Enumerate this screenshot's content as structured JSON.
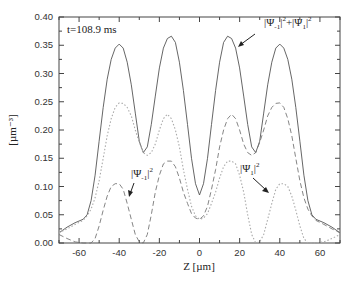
{
  "chart_data": {
    "type": "line",
    "title": "",
    "xlabel": "Z [µm]",
    "ylabel": "[µm⁻³]",
    "xlim": [
      -70,
      70
    ],
    "ylim": [
      0.0,
      0.4
    ],
    "x_ticks": [
      -60,
      -40,
      -20,
      0,
      20,
      40,
      60
    ],
    "x_tick_labels": [
      "-60",
      "-40",
      "-20",
      "0",
      "20",
      "40",
      "60"
    ],
    "y_ticks": [
      0.0,
      0.05,
      0.1,
      0.15,
      0.2,
      0.25,
      0.3,
      0.35,
      0.4
    ],
    "y_tick_labels": [
      "0.00",
      "0.05",
      "0.10",
      "0.15",
      "0.20",
      "0.25",
      "0.30",
      "0.35",
      "0.40"
    ],
    "grid": false,
    "legend": "none (inline annotations)",
    "x": [
      -70,
      -66,
      -62,
      -58,
      -56,
      -54,
      -52,
      -50,
      -48,
      -46,
      -44,
      -42,
      -40,
      -38,
      -36,
      -34,
      -32,
      -30,
      -28,
      -26,
      -24,
      -22,
      -20,
      -18,
      -16,
      -14,
      -12,
      -10,
      -8,
      -6,
      -4,
      -2,
      0,
      2,
      4,
      6,
      8,
      10,
      12,
      14,
      16,
      18,
      20,
      22,
      24,
      26,
      28,
      30,
      32,
      34,
      36,
      38,
      40,
      42,
      44,
      46,
      48,
      50,
      52,
      54,
      56,
      58,
      62,
      66,
      70
    ],
    "series": [
      {
        "name": "|Ψ-1|²+|Ψ1|²",
        "style": "solid",
        "values": [
          0.018,
          0.028,
          0.036,
          0.042,
          0.05,
          0.075,
          0.12,
          0.18,
          0.24,
          0.29,
          0.325,
          0.345,
          0.352,
          0.345,
          0.32,
          0.28,
          0.23,
          0.18,
          0.16,
          0.17,
          0.21,
          0.26,
          0.31,
          0.345,
          0.362,
          0.366,
          0.355,
          0.32,
          0.27,
          0.21,
          0.15,
          0.105,
          0.085,
          0.105,
          0.15,
          0.21,
          0.27,
          0.32,
          0.355,
          0.366,
          0.362,
          0.345,
          0.31,
          0.26,
          0.21,
          0.17,
          0.16,
          0.18,
          0.23,
          0.28,
          0.32,
          0.345,
          0.352,
          0.345,
          0.325,
          0.29,
          0.24,
          0.18,
          0.12,
          0.075,
          0.05,
          0.042,
          0.036,
          0.028,
          0.018
        ]
      },
      {
        "name": "|Ψ-1|²",
        "style": "dashed",
        "values": [
          0.015,
          0.008,
          0.002,
          0.0,
          0.0,
          0.0,
          0.008,
          0.03,
          0.058,
          0.083,
          0.1,
          0.105,
          0.105,
          0.095,
          0.07,
          0.042,
          0.015,
          0.002,
          0.0,
          0.015,
          0.05,
          0.09,
          0.12,
          0.14,
          0.145,
          0.145,
          0.135,
          0.115,
          0.09,
          0.07,
          0.052,
          0.044,
          0.042,
          0.048,
          0.065,
          0.095,
          0.13,
          0.17,
          0.2,
          0.22,
          0.228,
          0.22,
          0.2,
          0.175,
          0.16,
          0.155,
          0.16,
          0.178,
          0.2,
          0.225,
          0.24,
          0.247,
          0.248,
          0.24,
          0.22,
          0.19,
          0.15,
          0.11,
          0.08,
          0.06,
          0.048,
          0.04,
          0.033,
          0.025,
          0.018
        ]
      },
      {
        "name": "|Ψ1|²",
        "style": "dotted",
        "values": [
          0.018,
          0.025,
          0.033,
          0.04,
          0.048,
          0.06,
          0.08,
          0.11,
          0.15,
          0.19,
          0.22,
          0.24,
          0.248,
          0.247,
          0.24,
          0.225,
          0.2,
          0.178,
          0.16,
          0.155,
          0.16,
          0.175,
          0.2,
          0.22,
          0.228,
          0.22,
          0.2,
          0.17,
          0.13,
          0.095,
          0.065,
          0.048,
          0.042,
          0.044,
          0.052,
          0.07,
          0.09,
          0.115,
          0.135,
          0.145,
          0.145,
          0.14,
          0.12,
          0.09,
          0.05,
          0.015,
          0.0,
          0.002,
          0.015,
          0.042,
          0.07,
          0.095,
          0.105,
          0.105,
          0.1,
          0.083,
          0.058,
          0.03,
          0.008,
          0.0,
          0.0,
          0.0,
          0.002,
          0.008,
          0.015
        ]
      }
    ],
    "annotations": [
      {
        "text": "t=108.9 ms"
      },
      {
        "text_main": "|Ψ",
        "sub": "-1",
        "sup": "2",
        "plus": "+|Ψ",
        "sub2": "1",
        "sup2": "2",
        "target": "solid curve"
      },
      {
        "text_main": "|Ψ",
        "sub": "-1",
        "sup": "2",
        "target": "dashed curve"
      },
      {
        "text_main": "|Ψ",
        "sub": "1",
        "sup": "2",
        "target": "dotted curve"
      }
    ]
  }
}
